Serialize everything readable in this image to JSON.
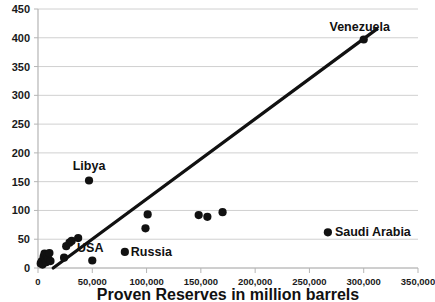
{
  "chart_data": {
    "type": "scatter",
    "title": "",
    "subtitle": "",
    "xlabel": "Proven Reserves in million barrels",
    "ylabel": "",
    "xlim": [
      0,
      350000
    ],
    "ylim": [
      0,
      450
    ],
    "grid": true,
    "legend": null,
    "x_ticks": [
      0,
      50000,
      100000,
      150000,
      200000,
      250000,
      300000,
      350000
    ],
    "x_tick_labels": [
      "0",
      "50,000",
      "100,000",
      "150,000",
      "200,000",
      "250,000",
      "300,000",
      "350,000"
    ],
    "y_ticks": [
      0,
      50,
      100,
      150,
      200,
      250,
      300,
      350,
      400,
      450
    ],
    "y_tick_labels": [
      "0",
      "50",
      "100",
      "150",
      "200",
      "250",
      "300",
      "350",
      "400",
      "450"
    ],
    "marker_color": "#111111",
    "trendline_color": "#111111",
    "gridline_color": "#d0d0d0",
    "points": [
      {
        "x": 2500,
        "y": 8,
        "label": ""
      },
      {
        "x": 3500,
        "y": 12,
        "label": ""
      },
      {
        "x": 4200,
        "y": 6,
        "label": ""
      },
      {
        "x": 5200,
        "y": 20,
        "label": ""
      },
      {
        "x": 6000,
        "y": 25,
        "label": ""
      },
      {
        "x": 6800,
        "y": 14,
        "label": ""
      },
      {
        "x": 7600,
        "y": 10,
        "label": ""
      },
      {
        "x": 8400,
        "y": 22,
        "label": ""
      },
      {
        "x": 9500,
        "y": 16,
        "label": ""
      },
      {
        "x": 10500,
        "y": 26,
        "label": ""
      },
      {
        "x": 11500,
        "y": 12,
        "label": ""
      },
      {
        "x": 24000,
        "y": 18,
        "label": ""
      },
      {
        "x": 26000,
        "y": 38,
        "label": ""
      },
      {
        "x": 29000,
        "y": 44,
        "label": ""
      },
      {
        "x": 31000,
        "y": 47,
        "label": ""
      },
      {
        "x": 37000,
        "y": 52,
        "label": ""
      },
      {
        "x": 47000,
        "y": 152,
        "label": "Libya"
      },
      {
        "x": 50000,
        "y": 13,
        "label": "USA"
      },
      {
        "x": 80000,
        "y": 28,
        "label": "Russia"
      },
      {
        "x": 99000,
        "y": 69,
        "label": ""
      },
      {
        "x": 101000,
        "y": 93,
        "label": ""
      },
      {
        "x": 148000,
        "y": 92,
        "label": ""
      },
      {
        "x": 156000,
        "y": 89,
        "label": ""
      },
      {
        "x": 170000,
        "y": 97,
        "label": ""
      },
      {
        "x": 267000,
        "y": 62,
        "label": "Saudi Arabia"
      },
      {
        "x": 300000,
        "y": 397,
        "label": "Venezuela"
      }
    ],
    "trendline": {
      "x0": 14000,
      "y0": 0,
      "x1": 312000,
      "y1": 415
    },
    "annotations": [
      {
        "text": "Libya",
        "anchor_x": 47000,
        "anchor_y": 152
      },
      {
        "text": "USA",
        "anchor_x": 50000,
        "anchor_y": 13
      },
      {
        "text": "Russia",
        "anchor_x": 80000,
        "anchor_y": 28
      },
      {
        "text": "Saudi Arabia",
        "anchor_x": 267000,
        "anchor_y": 62
      },
      {
        "text": "Venezuela",
        "anchor_x": 300000,
        "anchor_y": 397
      }
    ]
  }
}
